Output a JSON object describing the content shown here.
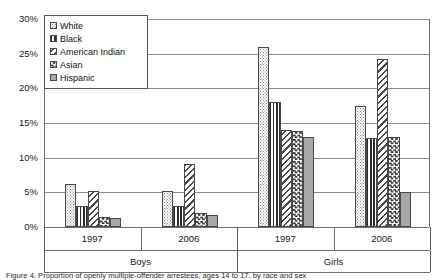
{
  "chart_data": {
    "type": "bar",
    "title": "",
    "xlabel": "",
    "ylabel": "",
    "ylim": [
      0,
      30
    ],
    "ytick_labels": [
      "30%",
      "25%",
      "20%",
      "15%",
      "10%",
      "5%",
      "0%"
    ],
    "ytick_values": [
      30,
      25,
      20,
      15,
      10,
      5,
      0
    ],
    "grid": true,
    "legend_position": "top-left",
    "categories": [
      "1997",
      "2006",
      "1997",
      "2006"
    ],
    "supercategories": [
      "Boys",
      "Girls"
    ],
    "series": [
      {
        "name": "White",
        "pattern": "dotted",
        "values": [
          6.2,
          5.2,
          26.0,
          17.5
        ]
      },
      {
        "name": "Black",
        "pattern": "vertical-stripe",
        "values": [
          3.0,
          3.0,
          18.0,
          12.8
        ]
      },
      {
        "name": "American Indian",
        "pattern": "diagonal-stripe",
        "values": [
          5.2,
          9.1,
          14.0,
          24.2
        ]
      },
      {
        "name": "Asian",
        "pattern": "checkerboard",
        "values": [
          1.5,
          2.0,
          13.8,
          13.0
        ]
      },
      {
        "name": "Hispanic",
        "pattern": "solid-gray",
        "values": [
          1.3,
          1.7,
          13.0,
          5.0
        ]
      }
    ]
  },
  "legend": {
    "items": [
      {
        "label": "White"
      },
      {
        "label": "Black"
      },
      {
        "label": "American Indian"
      },
      {
        "label": "Asian"
      },
      {
        "label": "Hispanic"
      }
    ]
  },
  "caption": {
    "text": "Figure 4.  Proportion of openly multiple-offender arrestees, ages 14 to 17, by race and sex"
  },
  "colors": {
    "axis": "#6f6f6f",
    "grid": "#8d8d8d",
    "bar_outline": "#4a4a4a",
    "hispanic_fill": "#a8a8a8",
    "text": "#1a1a1a"
  }
}
